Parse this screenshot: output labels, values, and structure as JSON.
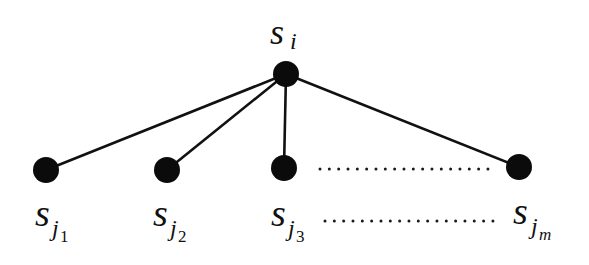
{
  "diagram": {
    "type": "star-tree",
    "root": {
      "id": "s_i",
      "label": "s",
      "subscript": "i",
      "subsubscript": ""
    },
    "children": [
      {
        "id": "s_j1",
        "label": "s",
        "subscript": "j",
        "subsubscript": "1"
      },
      {
        "id": "s_j2",
        "label": "s",
        "subscript": "j",
        "subsubscript": "2"
      },
      {
        "id": "s_j3",
        "label": "s",
        "subscript": "j",
        "subsubscript": "3"
      },
      {
        "id": "s_jm",
        "label": "s",
        "subscript": "j",
        "subsubscript": "m"
      }
    ],
    "edges": [
      {
        "from": "s_i",
        "to": "s_j1"
      },
      {
        "from": "s_i",
        "to": "s_j2"
      },
      {
        "from": "s_i",
        "to": "s_j3"
      },
      {
        "from": "s_i",
        "to": "s_jm"
      }
    ],
    "ellipsis": {
      "between_nodes": "dotted",
      "between_labels": "dotted"
    },
    "colors": {
      "node": "#0b0b0b",
      "edge": "#111111",
      "background": "#ffffff"
    }
  }
}
